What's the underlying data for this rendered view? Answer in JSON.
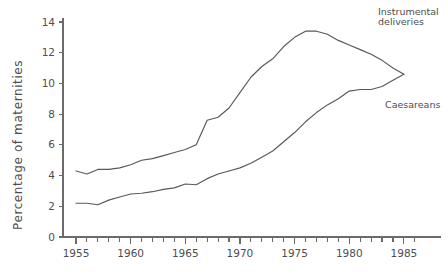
{
  "chart_data": {
    "type": "line",
    "title": "",
    "xlabel": "",
    "ylabel": "Percentage of maternities",
    "xlim": [
      1954.2,
      1986.5
    ],
    "ylim": [
      0,
      14.8
    ],
    "grid": false,
    "legend_position": "inline-right",
    "x_ticks_major": [
      1955,
      1960,
      1965,
      1970,
      1975,
      1980,
      1985
    ],
    "x_tick_labels": [
      "1955",
      "1960",
      "1965",
      "1970",
      "1975",
      "1980",
      "1985"
    ],
    "x_ticks_minor_step": 1,
    "y_ticks": [
      0,
      2,
      4,
      6,
      8,
      10,
      12,
      14
    ],
    "y_tick_labels": [
      "0",
      "2",
      "4",
      "6",
      "8",
      "10",
      "12",
      "14"
    ],
    "series": [
      {
        "name": "Instrumental deliveries",
        "label_text": "Instrumental\ndeliveries",
        "label_line1": "Instrumental",
        "label_line2": "deliveries",
        "color": "#58585c",
        "x": [
          1955,
          1956,
          1957,
          1958,
          1959,
          1960,
          1961,
          1962,
          1963,
          1964,
          1965,
          1966,
          1967,
          1968,
          1969,
          1970,
          1971,
          1972,
          1973,
          1974,
          1975,
          1976,
          1977,
          1978,
          1979,
          1980,
          1981,
          1982,
          1983,
          1984,
          1985
        ],
        "values": [
          4.3,
          4.1,
          4.4,
          4.4,
          4.5,
          4.7,
          5.0,
          5.1,
          5.3,
          5.5,
          5.7,
          6.0,
          7.6,
          7.8,
          8.4,
          9.4,
          10.4,
          11.1,
          11.6,
          12.4,
          13.0,
          13.4,
          13.4,
          13.2,
          12.8,
          12.5,
          12.2,
          11.9,
          11.5,
          11.0,
          10.6
        ]
      },
      {
        "name": "Caesareans",
        "label_text": "Caesareans",
        "color": "#58585c",
        "x": [
          1955,
          1956,
          1957,
          1958,
          1959,
          1960,
          1961,
          1962,
          1963,
          1964,
          1965,
          1966,
          1967,
          1968,
          1969,
          1970,
          1971,
          1972,
          1973,
          1974,
          1975,
          1976,
          1977,
          1978,
          1979,
          1980,
          1981,
          1982,
          1983,
          1984,
          1985
        ],
        "values": [
          2.2,
          2.2,
          2.1,
          2.4,
          2.6,
          2.8,
          2.85,
          2.95,
          3.1,
          3.2,
          3.45,
          3.4,
          3.8,
          4.1,
          4.3,
          4.5,
          4.8,
          5.2,
          5.6,
          6.2,
          6.8,
          7.5,
          8.1,
          8.6,
          9.0,
          9.5,
          9.6,
          9.6,
          9.8,
          10.2,
          10.6
        ]
      }
    ]
  },
  "axes": {
    "y_axis_title": "Percentage of maternities"
  }
}
